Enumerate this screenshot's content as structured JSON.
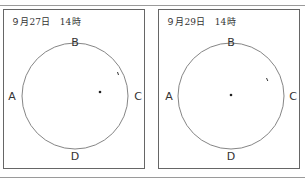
{
  "panels": [
    {
      "title": "９月27日　14時",
      "labels": {
        "top": "B",
        "left": "A",
        "right": "C",
        "bottom": "D"
      },
      "circle": {
        "cx": 71,
        "cy": 86,
        "r": 53
      },
      "center_dot": {
        "x": 96,
        "y": 82
      },
      "tick_mark": {
        "x": 114,
        "y": 63
      }
    },
    {
      "title": "９月29日　14時",
      "labels": {
        "top": "B",
        "left": "A",
        "right": "C",
        "bottom": "D"
      },
      "circle": {
        "cx": 72,
        "cy": 86,
        "r": 53
      },
      "center_dot": {
        "x": 72,
        "y": 85
      },
      "tick_mark": {
        "x": 108,
        "y": 69
      }
    }
  ],
  "colors": {
    "border": "#666666",
    "circle": "#777777",
    "text": "#333333",
    "rule": "#9a9a9a"
  }
}
